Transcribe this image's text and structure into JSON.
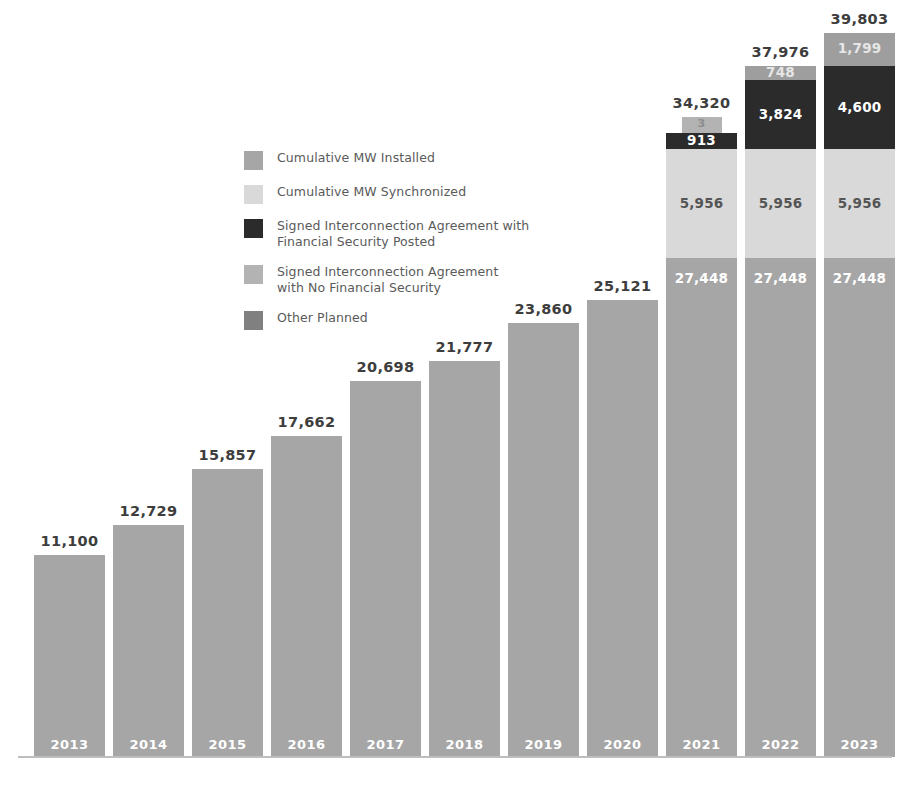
{
  "legend": {
    "items": [
      {
        "label": "Cumulative MW Installed",
        "color": "#a6a6a6",
        "key": "installed"
      },
      {
        "label": "Cumulative MW Synchronized",
        "color": "#d9d9d9",
        "key": "synchronized"
      },
      {
        "label": "Signed Interconnection Agreement with\nFinancial Security Posted",
        "color": "#2b2b2b",
        "key": "signed_fs"
      },
      {
        "label": "Signed Interconnection Agreement\nwith No Financial Security",
        "color": "#b3b3b3",
        "key": "signed_nofs"
      },
      {
        "label": "Other Planned",
        "color": "#808080",
        "key": "other_planned"
      }
    ]
  },
  "colors": {
    "installed": "#a6a6a6",
    "synchronized": "#d9d9d9",
    "signed_fs": "#2b2b2b",
    "signed_nofs": "#b3b3b3",
    "other_planned": "#9e9e9e",
    "background": "#ffffff",
    "total_text": "#3d3d3d",
    "axis": "#bdbdbd"
  },
  "chart_data": {
    "type": "bar",
    "subtype": "stacked-bar",
    "title": "",
    "subtitle": "",
    "xlabel": "",
    "ylabel": "",
    "grid": false,
    "legend_position": "center-left",
    "ylim": [
      0,
      39803
    ],
    "categories": [
      "2013",
      "2014",
      "2015",
      "2016",
      "2017",
      "2018",
      "2019",
      "2020",
      "2021",
      "2022",
      "2023"
    ],
    "totals": [
      11100,
      12729,
      15857,
      17662,
      20698,
      21777,
      23860,
      25121,
      34320,
      37976,
      39803
    ],
    "total_labels": [
      "11,100",
      "12,729",
      "15,857",
      "17,662",
      "20,698",
      "21,777",
      "23,860",
      "25,121",
      "34,320",
      "37,976",
      "39,803"
    ],
    "series": [
      {
        "name": "Cumulative MW Installed",
        "key": "installed",
        "values": [
          11100,
          12729,
          15857,
          17662,
          20698,
          21777,
          23860,
          25121,
          27448,
          27448,
          27448
        ],
        "labels": [
          "",
          "",
          "",
          "",
          "",
          "",
          "",
          "",
          "27,448",
          "27,448",
          "27,448"
        ]
      },
      {
        "name": "Cumulative MW Synchronized",
        "key": "synchronized",
        "values": [
          0,
          0,
          0,
          0,
          0,
          0,
          0,
          0,
          5956,
          5956,
          5956
        ],
        "labels": [
          "",
          "",
          "",
          "",
          "",
          "",
          "",
          "",
          "5,956",
          "5,956",
          "5,956"
        ]
      },
      {
        "name": "Signed Interconnection Agreement with Financial Security Posted",
        "key": "signed_fs",
        "values": [
          0,
          0,
          0,
          0,
          0,
          0,
          0,
          0,
          913,
          3824,
          4600
        ],
        "labels": [
          "",
          "",
          "",
          "",
          "",
          "",
          "",
          "",
          "913",
          "3,824",
          "4,600"
        ]
      },
      {
        "name": "Signed Interconnection Agreement with No Financial Security",
        "key": "signed_nofs",
        "values": [
          0,
          0,
          0,
          0,
          0,
          0,
          0,
          0,
          3,
          0,
          0
        ],
        "labels": [
          "",
          "",
          "",
          "",
          "",
          "",
          "",
          "",
          "3",
          "",
          ""
        ]
      },
      {
        "name": "Other Planned",
        "key": "other_planned",
        "values": [
          0,
          0,
          0,
          0,
          0,
          0,
          0,
          0,
          0,
          748,
          1799
        ],
        "labels": [
          "",
          "",
          "",
          "",
          "",
          "",
          "",
          "",
          "",
          "748",
          "1,799"
        ]
      }
    ]
  }
}
